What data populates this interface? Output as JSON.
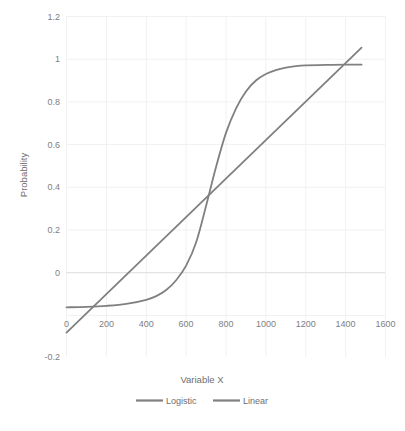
{
  "chart_data": {
    "type": "line",
    "title": "",
    "xlabel": "Variable X",
    "ylabel": "Probability",
    "xlim": [
      0,
      1600
    ],
    "ylim": [
      -0.2,
      1.2
    ],
    "xticks": [
      0,
      200,
      400,
      600,
      800,
      1000,
      1200,
      1400,
      1600
    ],
    "xtick_labels": [
      "0",
      "200",
      "400",
      "600",
      "800",
      "1000",
      "1200",
      "1400",
      "1600"
    ],
    "yticks": [
      -0.2,
      0,
      0.2,
      0.4,
      0.6,
      0.8,
      1,
      1.2
    ],
    "ytick_labels": [
      "-0.2",
      "0",
      "0.2",
      "0.4",
      "0.6",
      "0.8",
      "1",
      "1.2"
    ],
    "grid": true,
    "legend_position": "bottom",
    "series": [
      {
        "name": "Logistic",
        "color": "#808080",
        "x": [
          0,
          100,
          200,
          300,
          400,
          450,
          500,
          550,
          600,
          650,
          700,
          750,
          800,
          850,
          900,
          950,
          1000,
          1050,
          1100,
          1150,
          1200,
          1300,
          1400,
          1480
        ],
        "values": [
          0.004,
          0.006,
          0.01,
          0.018,
          0.035,
          0.05,
          0.075,
          0.115,
          0.175,
          0.27,
          0.42,
          0.58,
          0.72,
          0.82,
          0.89,
          0.935,
          0.962,
          0.978,
          0.988,
          0.994,
          0.997,
          0.999,
          1.0,
          1.0
        ]
      },
      {
        "name": "Linear",
        "color": "#808080",
        "x": [
          0,
          1480
        ],
        "values": [
          -0.1,
          1.07
        ]
      }
    ]
  },
  "axes": {
    "y_title": "Probability",
    "x_title": "Variable X"
  },
  "legend": {
    "items": [
      {
        "label": "Logistic",
        "color": "#808080"
      },
      {
        "label": "Linear",
        "color": "#808080"
      }
    ]
  },
  "caption": {
    "text": ""
  }
}
